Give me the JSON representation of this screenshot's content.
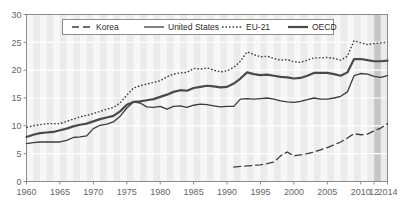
{
  "chart_data": {
    "type": "line",
    "title": "",
    "subtitle": "",
    "xlabel": "",
    "ylabel": "",
    "xlim": [
      1960,
      2014
    ],
    "ylim": [
      0,
      30
    ],
    "yticks": [
      0,
      5,
      10,
      15,
      20,
      25,
      30
    ],
    "ytick_labels": [
      "0",
      "5",
      "10",
      "15",
      "20",
      "25",
      "30"
    ],
    "xticks": [
      1960,
      1965,
      1970,
      1975,
      1980,
      1985,
      1990,
      1995,
      2000,
      2005,
      2010,
      2012,
      2014
    ],
    "xtick_labels": [
      "1960",
      "1965",
      "1970",
      "1975",
      "1980",
      "1985",
      "1990",
      "1995",
      "2000",
      "2005",
      "2010",
      "12",
      "2014"
    ],
    "grid": "horizontal-white-and-vertical-year-bands",
    "legend_position": "top-center",
    "legend": [
      "Korea",
      "United States",
      "EU-21",
      "OECD"
    ],
    "shaded_band": {
      "from": 2012,
      "to": 2013,
      "color": "#bdbdbd"
    },
    "series": [
      {
        "name": "Korea",
        "style": "dashed",
        "color": "#3c3c3c",
        "width": 1.3,
        "x": [
          1991,
          1992,
          1993,
          1994,
          1995,
          1996,
          1997,
          1998,
          1999,
          2000,
          2001,
          2002,
          2003,
          2004,
          2005,
          2006,
          2007,
          2008,
          2009,
          2010,
          2011,
          2012,
          2013,
          2014
        ],
        "values": [
          2.6,
          2.7,
          2.8,
          2.9,
          3.0,
          3.2,
          3.5,
          4.6,
          5.3,
          4.6,
          4.8,
          5.0,
          5.3,
          5.7,
          6.1,
          6.6,
          7.1,
          7.8,
          8.6,
          8.4,
          8.5,
          9.1,
          9.6,
          10.4
        ]
      },
      {
        "name": "United States",
        "style": "solid-thin",
        "color": "#3c3c3c",
        "width": 1.3,
        "x": [
          1960,
          1961,
          1962,
          1963,
          1964,
          1965,
          1966,
          1967,
          1968,
          1969,
          1970,
          1971,
          1972,
          1973,
          1974,
          1975,
          1976,
          1977,
          1978,
          1979,
          1980,
          1981,
          1982,
          1983,
          1984,
          1985,
          1986,
          1987,
          1988,
          1989,
          1990,
          1991,
          1992,
          1993,
          1994,
          1995,
          1996,
          1997,
          1998,
          1999,
          2000,
          2001,
          2002,
          2003,
          2004,
          2005,
          2006,
          2007,
          2008,
          2009,
          2010,
          2011,
          2012,
          2013,
          2014
        ],
        "values": [
          6.8,
          7.0,
          7.1,
          7.1,
          7.1,
          7.1,
          7.4,
          7.9,
          8.0,
          8.2,
          9.5,
          10.1,
          10.3,
          10.7,
          11.7,
          13.2,
          14.3,
          14.1,
          13.4,
          13.3,
          13.5,
          13.0,
          13.5,
          13.6,
          13.3,
          13.7,
          13.9,
          13.8,
          13.6,
          13.4,
          13.5,
          13.5,
          14.8,
          14.9,
          14.8,
          14.9,
          15.0,
          14.8,
          14.5,
          14.3,
          14.2,
          14.4,
          14.7,
          15.0,
          14.8,
          14.8,
          15.0,
          15.3,
          16.1,
          19.0,
          19.4,
          19.3,
          18.9,
          18.7,
          19.0
        ]
      },
      {
        "name": "EU-21",
        "style": "dotted",
        "color": "#3c3c3c",
        "width": 1.4,
        "x": [
          1960,
          1961,
          1962,
          1963,
          1964,
          1965,
          1966,
          1967,
          1968,
          1969,
          1970,
          1971,
          1972,
          1973,
          1974,
          1975,
          1976,
          1977,
          1978,
          1979,
          1980,
          1981,
          1982,
          1983,
          1984,
          1985,
          1986,
          1987,
          1988,
          1989,
          1990,
          1991,
          1992,
          1993,
          1994,
          1995,
          1996,
          1997,
          1998,
          1999,
          2000,
          2001,
          2002,
          2003,
          2004,
          2005,
          2006,
          2007,
          2008,
          2009,
          2010,
          2011,
          2012,
          2013,
          2014
        ],
        "values": [
          9.7,
          10.0,
          10.2,
          10.4,
          10.4,
          10.4,
          10.8,
          11.2,
          11.6,
          11.9,
          12.2,
          12.6,
          13.0,
          13.3,
          14.1,
          15.5,
          16.8,
          17.2,
          17.5,
          17.8,
          18.1,
          18.8,
          19.3,
          19.5,
          19.6,
          20.3,
          20.2,
          20.4,
          20.0,
          19.7,
          19.9,
          20.5,
          21.6,
          23.3,
          22.8,
          22.4,
          22.5,
          22.1,
          21.8,
          21.9,
          21.5,
          21.4,
          21.8,
          22.2,
          22.2,
          22.3,
          22.1,
          21.8,
          22.5,
          25.3,
          24.9,
          24.6,
          24.8,
          24.9,
          25.0
        ]
      },
      {
        "name": "OECD",
        "style": "solid-thick",
        "color": "#4a4a4a",
        "width": 2.2,
        "x": [
          1960,
          1961,
          1962,
          1963,
          1964,
          1965,
          1966,
          1967,
          1968,
          1969,
          1970,
          1971,
          1972,
          1973,
          1974,
          1975,
          1976,
          1977,
          1978,
          1979,
          1980,
          1981,
          1982,
          1983,
          1984,
          1985,
          1986,
          1987,
          1988,
          1989,
          1990,
          1991,
          1992,
          1993,
          1994,
          1995,
          1996,
          1997,
          1998,
          1999,
          2000,
          2001,
          2002,
          2003,
          2004,
          2005,
          2006,
          2007,
          2008,
          2009,
          2010,
          2011,
          2012,
          2013,
          2014
        ],
        "values": [
          8.0,
          8.4,
          8.7,
          8.8,
          8.9,
          9.2,
          9.5,
          9.9,
          10.2,
          10.4,
          10.8,
          11.2,
          11.5,
          11.8,
          12.6,
          13.8,
          14.3,
          14.4,
          14.6,
          14.8,
          15.2,
          15.6,
          16.1,
          16.4,
          16.3,
          16.8,
          17.0,
          17.2,
          17.1,
          16.9,
          17.0,
          17.6,
          18.5,
          19.6,
          19.3,
          19.1,
          19.2,
          19.0,
          18.8,
          18.7,
          18.5,
          18.6,
          19.0,
          19.5,
          19.5,
          19.5,
          19.3,
          19.0,
          19.6,
          22.0,
          22.0,
          21.8,
          21.6,
          21.6,
          21.7
        ]
      }
    ]
  },
  "legend": {
    "items": [
      {
        "label": "Korea",
        "style": "dashed"
      },
      {
        "label": "United States",
        "style": "solid-thin"
      },
      {
        "label": "EU-21",
        "style": "dotted"
      },
      {
        "label": "OECD",
        "style": "solid-thick"
      }
    ]
  },
  "colors": {
    "plot_background": "#ebebeb",
    "stripe": "#f7f7f7",
    "gridline": "#ffffff",
    "axis": "#8c8c8c",
    "series": "#3c3c3c",
    "shaded_band": "#bdbdbd",
    "tick_label": "#666666"
  }
}
